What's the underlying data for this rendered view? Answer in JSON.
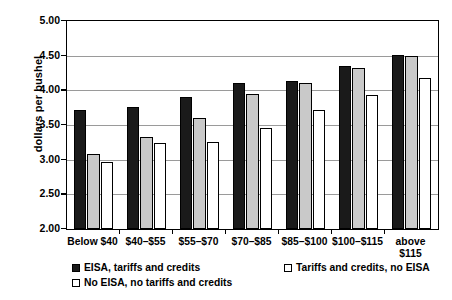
{
  "chart_data": {
    "type": "bar",
    "title": "",
    "xlabel": "",
    "ylabel": "dollars per bushel",
    "ylim": [
      2.0,
      5.0
    ],
    "ytick_step": 0.5,
    "yticks": [
      "5.00",
      "4.50",
      "4.00",
      "3.50",
      "3.00",
      "2.50",
      "2.00"
    ],
    "ytick_values": [
      5.0,
      4.5,
      4.0,
      3.5,
      3.0,
      2.5,
      2.0
    ],
    "grid": true,
    "legend_position": "bottom",
    "categories": [
      "Below $40",
      "$40–$55",
      "$55–$70",
      "$70–$85",
      "$85–$100",
      "$100–$115",
      "above\n$115"
    ],
    "series": [
      {
        "name": "EISA, tariffs and credits",
        "color": "#1a1a1a",
        "values": [
          3.71,
          3.76,
          3.9,
          4.1,
          4.14,
          4.35,
          4.51
        ]
      },
      {
        "name": "Tariffs and credits, no EISA",
        "color": "#c9c9c9",
        "values": [
          3.08,
          3.32,
          3.6,
          3.95,
          4.1,
          4.32,
          4.5
        ]
      },
      {
        "name": "No EISA, no tariffs and credits",
        "color": "#ffffff",
        "values": [
          2.96,
          3.24,
          3.26,
          3.45,
          3.72,
          3.94,
          4.18
        ]
      }
    ]
  },
  "legend": {
    "items": [
      {
        "label": "EISA, tariffs and credits",
        "swatch": "filled-black"
      },
      {
        "label": "Tariffs and credits, no EISA",
        "swatch": "filled-gray"
      },
      {
        "label": "No EISA, no tariffs and credits",
        "swatch": "outline-white"
      }
    ]
  }
}
